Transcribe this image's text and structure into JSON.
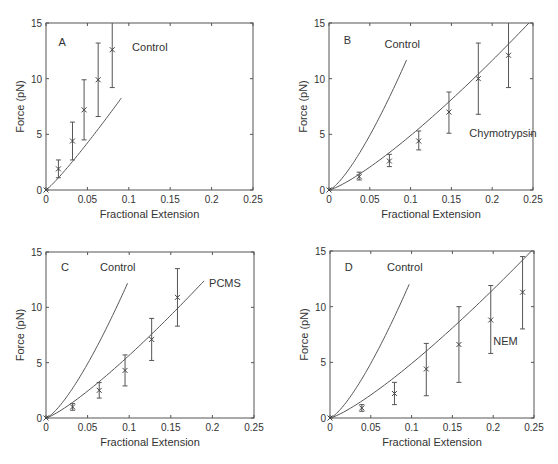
{
  "figure": {
    "xlabel": "Fractional Extension",
    "ylabel": "Force (pN)",
    "xticks": [
      "0",
      "0.05",
      "0.1",
      "0.15",
      "0.2",
      "0.25"
    ],
    "yticks": [
      "0",
      "5",
      "10",
      "15"
    ]
  },
  "chart_data": [
    {
      "type": "line",
      "panel": "A",
      "xlabel": "Fractional Extension",
      "ylabel": "Force (pN)",
      "xlim": [
        0,
        0.25
      ],
      "ylim": [
        0,
        15
      ],
      "grid": false,
      "frame": {
        "left": 46,
        "top": 23,
        "right": 253,
        "bottom": 190
      },
      "labels": [
        {
          "text": "A",
          "x": 0.015,
          "y": 13.3,
          "kind": "letter"
        },
        {
          "text": "Control",
          "x": 0.104,
          "y": 12.8,
          "kind": "curve"
        }
      ],
      "fits": [
        {
          "name": "Control",
          "x_end": 0.091,
          "k": 121,
          "p": 1.12
        }
      ],
      "series": [
        {
          "name": "Control",
          "x": [
            0,
            0.015,
            0.032,
            0.046,
            0.063,
            0.08
          ],
          "y": [
            0,
            1.9,
            4.4,
            7.2,
            9.9,
            12.6
          ],
          "err_low": [
            0,
            1.1,
            2.7,
            4.5,
            6.6,
            9.2
          ],
          "err_high": [
            0,
            2.7,
            6.1,
            9.9,
            13.2,
            15.0
          ]
        }
      ]
    },
    {
      "type": "line",
      "panel": "B",
      "xlabel": "Fractional Extension",
      "ylabel": "Force (pN)",
      "xlim": [
        0,
        0.25
      ],
      "ylim": [
        0,
        15
      ],
      "grid": false,
      "frame": {
        "left": 329,
        "top": 23,
        "right": 533,
        "bottom": 190
      },
      "labels": [
        {
          "text": "B",
          "x": 0.018,
          "y": 13.5,
          "kind": "letter"
        },
        {
          "text": "Control",
          "x": 0.068,
          "y": 13.1,
          "kind": "curve"
        },
        {
          "text": "Chymotrypsin",
          "x": 0.172,
          "y": 5.1,
          "kind": "curve"
        }
      ],
      "fits": [
        {
          "name": "Control",
          "x_end": 0.095,
          "k": 280,
          "p": 1.35
        },
        {
          "name": "Chymotrypsin",
          "x_end": 0.245,
          "k": 87,
          "p": 1.25
        }
      ],
      "series": [
        {
          "name": "Chymotrypsin",
          "x": [
            0,
            0.037,
            0.074,
            0.11,
            0.147,
            0.183,
            0.22
          ],
          "y": [
            0,
            1.2,
            2.6,
            4.4,
            7.0,
            10.0,
            12.1
          ],
          "err_low": [
            0,
            0.9,
            2.1,
            3.6,
            5.1,
            6.8,
            9.2
          ],
          "err_high": [
            0,
            1.6,
            3.2,
            5.3,
            8.8,
            13.2,
            15.0
          ]
        }
      ]
    },
    {
      "type": "line",
      "panel": "C",
      "xlabel": "Fractional Extension",
      "ylabel": "Force (pN)",
      "xlim": [
        0,
        0.25
      ],
      "ylim": [
        0,
        15
      ],
      "grid": false,
      "frame": {
        "left": 46,
        "top": 252,
        "right": 254,
        "bottom": 418
      },
      "labels": [
        {
          "text": "C",
          "x": 0.018,
          "y": 13.6,
          "kind": "letter"
        },
        {
          "text": "Control",
          "x": 0.065,
          "y": 13.6,
          "kind": "curve"
        },
        {
          "text": "PCMS",
          "x": 0.196,
          "y": 12.2,
          "kind": "curve"
        }
      ],
      "fits": [
        {
          "name": "Control",
          "x_end": 0.098,
          "k": 280,
          "p": 1.35
        },
        {
          "name": "PCMS",
          "x_end": 0.19,
          "k": 94,
          "p": 1.22
        }
      ],
      "series": [
        {
          "name": "PCMS",
          "x": [
            0,
            0.032,
            0.064,
            0.095,
            0.127,
            0.158
          ],
          "y": [
            0,
            1.0,
            2.5,
            4.3,
            7.1,
            10.9
          ],
          "err_low": [
            0,
            0.7,
            1.8,
            2.9,
            5.2,
            8.3
          ],
          "err_high": [
            0,
            1.3,
            3.2,
            5.7,
            9.0,
            13.5
          ]
        }
      ]
    },
    {
      "type": "line",
      "panel": "D",
      "xlabel": "Fractional Extension",
      "ylabel": "Force (pN)",
      "xlim": [
        0,
        0.25
      ],
      "ylim": [
        0,
        15
      ],
      "grid": false,
      "frame": {
        "left": 330,
        "top": 251,
        "right": 534,
        "bottom": 418
      },
      "labels": [
        {
          "text": "D",
          "x": 0.018,
          "y": 13.6,
          "kind": "letter"
        },
        {
          "text": "Control",
          "x": 0.07,
          "y": 13.6,
          "kind": "curve"
        },
        {
          "text": "NEM",
          "x": 0.2,
          "y": 6.9,
          "kind": "curve"
        }
      ],
      "fits": [
        {
          "name": "Control",
          "x_end": 0.097,
          "k": 280,
          "p": 1.35
        },
        {
          "name": "NEM",
          "x_end": 0.25,
          "k": 85,
          "p": 1.24
        }
      ],
      "series": [
        {
          "name": "NEM",
          "x": [
            0,
            0.039,
            0.079,
            0.118,
            0.158,
            0.197,
            0.236
          ],
          "y": [
            0,
            0.9,
            2.2,
            4.4,
            6.6,
            8.8,
            11.3
          ],
          "err_low": [
            0,
            0.6,
            1.2,
            2.0,
            3.2,
            5.8,
            8.0
          ],
          "err_high": [
            0,
            1.2,
            3.2,
            6.7,
            10.0,
            11.9,
            14.5
          ]
        }
      ]
    }
  ]
}
